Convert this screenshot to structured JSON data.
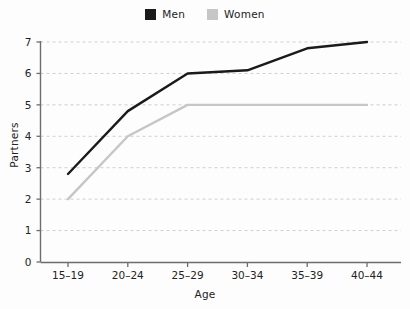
{
  "legend": {
    "position": "top-center",
    "entries": [
      {
        "label": "Men",
        "color": "#1a1a1a",
        "swatch": "legend-swatch-men"
      },
      {
        "label": "Women",
        "color": "#c6c6c6",
        "swatch": "legend-swatch-women"
      }
    ]
  },
  "axes": {
    "x": {
      "title": "Age",
      "ticks": [
        "15–19",
        "20–24",
        "25–29",
        "30–34",
        "35–39",
        "40–44"
      ]
    },
    "y": {
      "title": "Partners",
      "ticks": [
        "0",
        "1",
        "2",
        "3",
        "4",
        "5",
        "6",
        "7"
      ],
      "min": 0,
      "max": 7
    }
  },
  "chart_data": {
    "type": "line",
    "title": "",
    "subtitle": "",
    "xlabel": "Age",
    "ylabel": "Partners",
    "categories": [
      "15–19",
      "20–24",
      "25–29",
      "30–34",
      "35–39",
      "40–44"
    ],
    "series": [
      {
        "name": "Men",
        "color": "#1a1a1a",
        "values": [
          2.8,
          4.8,
          6.0,
          6.1,
          6.8,
          7.0
        ]
      },
      {
        "name": "Women",
        "color": "#c6c6c6",
        "values": [
          2.0,
          4.0,
          5.0,
          5.0,
          5.0,
          5.0
        ]
      }
    ],
    "ylim": [
      0,
      7
    ],
    "yticks": [
      0,
      1,
      2,
      3,
      4,
      5,
      6,
      7
    ],
    "grid": {
      "horizontal": true,
      "vertical": false,
      "style": "dashed",
      "color": "#cfcfcf"
    },
    "legend": {
      "position": "top-center",
      "entries": [
        "Men",
        "Women"
      ]
    },
    "annotations": []
  }
}
